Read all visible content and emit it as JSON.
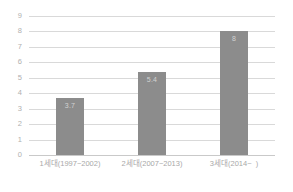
{
  "chart_data": {
    "type": "bar",
    "title": "",
    "subtitle": "",
    "xlabel": "",
    "ylabel": "",
    "categories": [
      "1세대(1997~2002)",
      "2세대(2007~2013)",
      "3세대(2014~  )"
    ],
    "values": [
      3.7,
      5.4,
      8
    ],
    "value_labels": [
      "3.7",
      "5.4",
      "8"
    ],
    "ylim": [
      0,
      9
    ],
    "yticks": [
      9,
      8,
      7,
      6,
      5,
      4,
      3,
      2,
      1,
      0
    ],
    "ytick_labels": [
      "9",
      "8",
      "7",
      "6",
      "5",
      "4",
      "3",
      "2",
      "1",
      "0"
    ],
    "grid": true,
    "grid_axis": "y",
    "legend": false,
    "legend_position": "none",
    "series": [
      {
        "name": "",
        "values": [
          3.7,
          5.4,
          8
        ]
      }
    ]
  },
  "style": {
    "bar_color": "#8c8c8c",
    "grid_color": "#d9d9d9",
    "axis_color": "#c9c9c9",
    "tick_text_color": "#b0b0b0",
    "category_text_color": "#a8a8a8",
    "value_label_color": "#d2d2d2",
    "background": "#ffffff"
  }
}
